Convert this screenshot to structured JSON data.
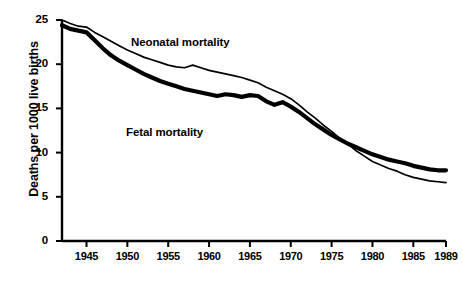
{
  "chart_data": {
    "type": "line",
    "title": "",
    "xlabel": "",
    "ylabel": "Deaths per 1000 live births",
    "xlim": [
      1942,
      1989
    ],
    "ylim": [
      0,
      25
    ],
    "grid": false,
    "legend_position": "inline-annotation",
    "x_ticks": [
      "1945",
      "1950",
      "1955",
      "1960",
      "1965",
      "1970",
      "1975",
      "1980",
      "1985",
      "1989"
    ],
    "x_tick_values": [
      1945,
      1950,
      1955,
      1960,
      1965,
      1970,
      1975,
      1980,
      1985,
      1989
    ],
    "y_ticks": [
      "0",
      "5",
      "10",
      "15",
      "20",
      "25"
    ],
    "y_tick_values": [
      0,
      5,
      10,
      15,
      20,
      25
    ],
    "x": [
      1942,
      1943,
      1944,
      1945,
      1946,
      1947,
      1948,
      1949,
      1950,
      1951,
      1952,
      1953,
      1954,
      1955,
      1956,
      1957,
      1958,
      1959,
      1960,
      1961,
      1962,
      1963,
      1964,
      1965,
      1966,
      1967,
      1968,
      1969,
      1970,
      1971,
      1972,
      1973,
      1974,
      1975,
      1976,
      1977,
      1978,
      1979,
      1980,
      1981,
      1982,
      1983,
      1984,
      1985,
      1986,
      1987,
      1988,
      1989
    ],
    "series": [
      {
        "name": "Neonatal mortality",
        "line_style": "thin",
        "color": "#000000",
        "values": [
          25.0,
          24.6,
          24.3,
          24.2,
          23.6,
          23.1,
          22.6,
          22.1,
          21.6,
          21.2,
          20.8,
          20.5,
          20.2,
          19.9,
          19.7,
          19.6,
          19.9,
          19.6,
          19.3,
          19.1,
          18.9,
          18.7,
          18.5,
          18.2,
          17.9,
          17.4,
          17.0,
          16.6,
          16.1,
          15.4,
          14.6,
          13.9,
          13.1,
          12.4,
          11.6,
          11.0,
          10.2,
          9.6,
          9.0,
          8.6,
          8.2,
          7.9,
          7.5,
          7.2,
          7.0,
          6.8,
          6.7,
          6.6
        ]
      },
      {
        "name": "Fetal mortality",
        "line_style": "thick",
        "color": "#000000",
        "values": [
          24.4,
          24.0,
          23.8,
          23.6,
          22.7,
          21.8,
          21.0,
          20.4,
          19.9,
          19.4,
          18.9,
          18.5,
          18.1,
          17.8,
          17.5,
          17.2,
          17.0,
          16.8,
          16.6,
          16.4,
          16.6,
          16.5,
          16.3,
          16.5,
          16.4,
          15.8,
          15.4,
          15.7,
          15.2,
          14.6,
          13.9,
          13.2,
          12.6,
          12.0,
          11.5,
          11.0,
          10.6,
          10.2,
          9.8,
          9.5,
          9.2,
          9.0,
          8.8,
          8.5,
          8.3,
          8.1,
          8.0,
          8.0
        ]
      }
    ],
    "annotations": [
      {
        "text": "Neonatal mortality",
        "x": 1957,
        "y": 21.8
      },
      {
        "text": "Fetal mortality",
        "x": 1956,
        "y": 11.0
      }
    ]
  }
}
